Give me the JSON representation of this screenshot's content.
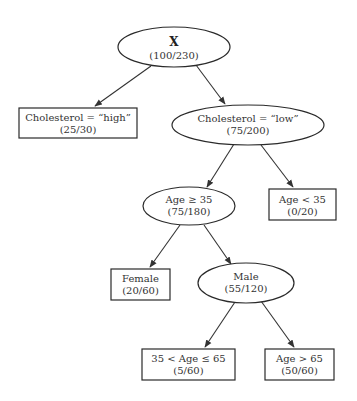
{
  "diagram": {
    "type": "decision-tree",
    "nodes": {
      "root": {
        "label": "X",
        "counts": "(100/230)",
        "shape": "ellipse"
      },
      "chol_high": {
        "label": "Cholesterol = “high”",
        "counts": "(25/30)",
        "shape": "box"
      },
      "chol_low": {
        "label": "Cholesterol = “low”",
        "counts": "(75/200)",
        "shape": "ellipse"
      },
      "age_ge_35": {
        "label": "Age ≥ 35",
        "counts": "(75/180)",
        "shape": "ellipse"
      },
      "age_lt_35": {
        "label": "Age < 35",
        "counts": "(0/20)",
        "shape": "box"
      },
      "female": {
        "label": "Female",
        "counts": "(20/60)",
        "shape": "box"
      },
      "male": {
        "label": "Male",
        "counts": "(55/120)",
        "shape": "ellipse"
      },
      "age_35_65": {
        "label": "35 < Age ≤ 65",
        "counts": "(5/60)",
        "shape": "box"
      },
      "age_gt_65": {
        "label": "Age > 65",
        "counts": "(50/60)",
        "shape": "box"
      }
    },
    "edges": [
      [
        "root",
        "chol_high"
      ],
      [
        "root",
        "chol_low"
      ],
      [
        "chol_low",
        "age_ge_35"
      ],
      [
        "chol_low",
        "age_lt_35"
      ],
      [
        "age_ge_35",
        "female"
      ],
      [
        "age_ge_35",
        "male"
      ],
      [
        "male",
        "age_35_65"
      ],
      [
        "male",
        "age_gt_65"
      ]
    ],
    "colors": {
      "stroke": "#2a2a2a",
      "text": "#333333",
      "background": "#ffffff"
    }
  }
}
